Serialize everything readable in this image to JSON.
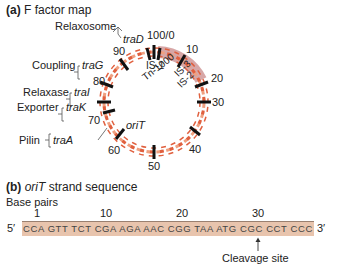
{
  "part_a": {
    "label": "(a)",
    "title": "F factor map",
    "ring_labels": [
      "100/0",
      "10",
      "20",
      "30",
      "40",
      "50",
      "60",
      "70",
      "80",
      "90"
    ],
    "inner_labels": [
      "IS-1",
      "Tn-1000",
      "IS-3",
      "IS-2",
      "oriT"
    ],
    "genes": [
      {
        "function": "Relaxosome",
        "gene": "traD"
      },
      {
        "function": "Coupling",
        "gene": "traG"
      },
      {
        "function": "Relaxase",
        "gene": "traI"
      },
      {
        "function": "Exporter",
        "gene": "traK"
      },
      {
        "function": "Pilin",
        "gene": "traA"
      }
    ],
    "colors": {
      "strand": "#e0603f",
      "strand_light": "#f0a080",
      "marker": "#111111",
      "is_region": "#c98a8a"
    }
  },
  "part_b": {
    "label": "(b)",
    "title_italic": "oriT",
    "title_rest": "strand sequence",
    "axis_label": "Base pairs",
    "ticks": [
      "1",
      "10",
      "20",
      "30"
    ],
    "five_prime": "5′",
    "three_prime": "3′",
    "sequence": "CCA GTT TCT CGA AGA AAC CGG TAA ATG CGC CCT CCC",
    "cleavage_label": "Cleavage site",
    "colors": {
      "bar": "#e8c4ad"
    }
  }
}
